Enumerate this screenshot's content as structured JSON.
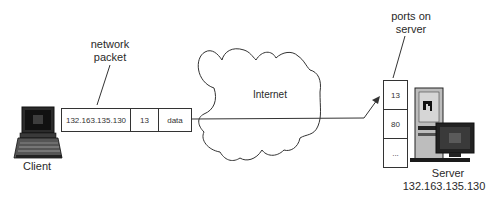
{
  "diagram": {
    "client": {
      "label": "Client",
      "icon": "laptop-icon"
    },
    "packet": {
      "callout": "network\npacket",
      "callout_line1": "network",
      "callout_line2": "packet",
      "fields": [
        {
          "name": "ip",
          "value": "132.163.135.130"
        },
        {
          "name": "port",
          "value": "13"
        },
        {
          "name": "payload",
          "value": "data"
        }
      ]
    },
    "cloud": {
      "label": "Internet",
      "icon": "cloud-icon"
    },
    "ports": {
      "callout_line1": "ports on",
      "callout_line2": "server",
      "items": [
        "13",
        "80",
        "..."
      ]
    },
    "server": {
      "label": "Server",
      "ip": "132.163.135.130",
      "icon": "server-computer-icon"
    },
    "colors": {
      "line": "#333333",
      "background": "#ffffff",
      "screen": "#1a1a1a"
    }
  }
}
